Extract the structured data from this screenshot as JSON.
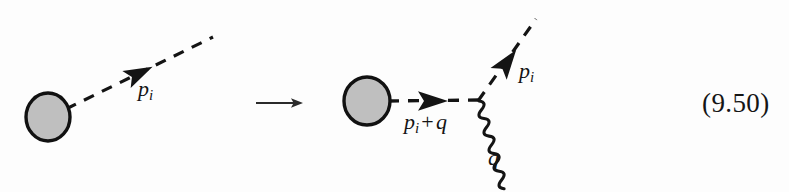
{
  "figure": {
    "kind": "feynman-diagram-equation",
    "equation_number": "(9.50)",
    "transform_operator": "⟶",
    "background_color": "#fdfdfd",
    "ink_color": "#141414",
    "blob_fill_color": "#bfbfbf",
    "blob_stroke_color": "#111111",
    "left_diagram": {
      "name": "initial-state-diagram",
      "blob": {
        "center_x": 48,
        "center_y": 117,
        "radius_x": 22,
        "radius_y": 24
      },
      "dashed_line": {
        "from_x": 68,
        "from_y": 108,
        "to_x": 213,
        "to_y": 37,
        "style": "dashed",
        "label": "p_i",
        "label_text": "p",
        "label_sub": "i"
      },
      "arrowhead": {
        "x": 140,
        "y": 73,
        "angle_deg": -26,
        "direction": "outgoing"
      }
    },
    "right_diagram": {
      "name": "emission-vertex-diagram",
      "blob": {
        "center_x": 367,
        "center_y": 101,
        "radius_x": 23,
        "radius_y": 24
      },
      "vertex": {
        "x": 478,
        "y": 100
      },
      "internal_line": {
        "from_x": 390,
        "from_y": 101,
        "to_x": 478,
        "to_y": 100,
        "style": "dashed",
        "label_text": "p",
        "label_sub": "i",
        "label_op": "+",
        "label_tail": "q",
        "label_full": "p_i + q"
      },
      "internal_arrowhead": {
        "x": 432,
        "y": 101,
        "angle_deg": 0,
        "direction": "rightward"
      },
      "outgoing_scalar": {
        "from_x": 478,
        "from_y": 100,
        "to_x": 535,
        "to_y": 20,
        "style": "dashed",
        "label_text": "p",
        "label_sub": "i",
        "label_full": "p_i"
      },
      "outgoing_arrowhead": {
        "x": 508,
        "y": 61,
        "angle_deg": -54,
        "direction": "outgoing"
      },
      "photon_line": {
        "from_x": 479,
        "from_y": 104,
        "to_x": 547,
        "to_y": 188,
        "style": "wavy",
        "label_text": "q",
        "label_full": "q",
        "wave_count": 9
      }
    }
  }
}
